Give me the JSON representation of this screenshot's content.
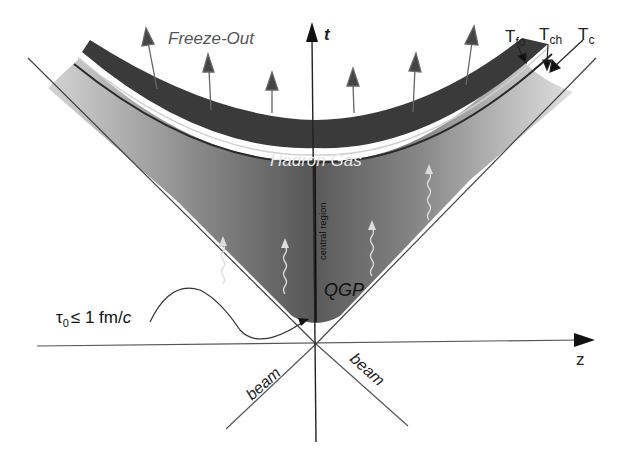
{
  "diagram": {
    "axes": {
      "time_label": "t",
      "space_label": "z",
      "beam_left_label": "beam",
      "beam_right_label": "beam"
    },
    "regions": {
      "freeze_out": "Freeze-Out",
      "hadron_gas": "Hadron Gas",
      "qgp": "QGP",
      "central_region": "central region"
    },
    "hypersurfaces": {
      "t_fo": "T",
      "t_fo_sub": "fo",
      "t_ch": "T",
      "t_ch_sub": "ch",
      "t_c": "T",
      "t_c_sub": "c"
    },
    "formation_time": {
      "tau": "τ",
      "tau_sub": "0",
      "relation": "≤ 1 fm/",
      "unit_c": "c"
    },
    "colors": {
      "hadron_band": "#3c3c3c",
      "qgp_dark": "#5a5a5a",
      "qgp_light": "#c8c8c8",
      "axis": "#333333",
      "arrow": "#555555",
      "wave": "#d8d8d8"
    }
  }
}
